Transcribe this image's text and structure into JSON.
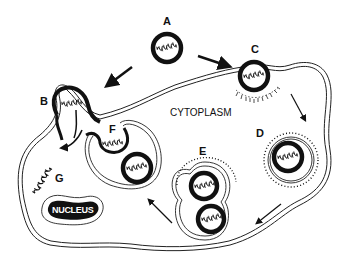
{
  "diagram": {
    "stage_labels": {
      "a": "A",
      "b": "B",
      "c": "C",
      "d": "D",
      "e": "E",
      "f": "F",
      "g": "G"
    },
    "region_labels": {
      "cytoplasm": "CYTOPLASM",
      "nucleus": "NUCLEUS"
    },
    "colors": {
      "ink": "#111111",
      "background": "#ffffff",
      "nucleus_fill": "#111111"
    }
  }
}
